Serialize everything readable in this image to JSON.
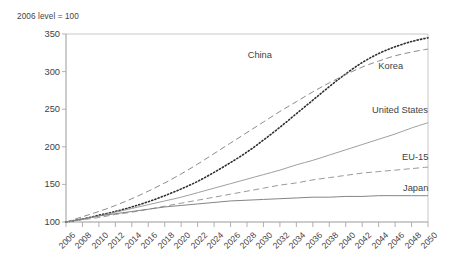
{
  "chart_data": {
    "type": "line",
    "title": "",
    "subtitle": "2006 level = 100",
    "xlabel": "",
    "ylabel": "",
    "xlim": [
      2006,
      2050
    ],
    "ylim": [
      100,
      350
    ],
    "yticks": [
      100,
      150,
      200,
      250,
      300,
      350
    ],
    "grid": false,
    "legend_position": "inline-right",
    "x": [
      2006,
      2008,
      2010,
      2012,
      2014,
      2016,
      2018,
      2020,
      2022,
      2024,
      2026,
      2028,
      2030,
      2032,
      2034,
      2036,
      2038,
      2040,
      2042,
      2044,
      2046,
      2048,
      2050
    ],
    "xticklabels": [
      "2006",
      "2008",
      "2010",
      "2012",
      "2014",
      "2016",
      "2018",
      "2020",
      "2022",
      "2024",
      "2026",
      "2028",
      "2030",
      "2032",
      "2034",
      "2036",
      "2038",
      "2040",
      "2042",
      "2044",
      "2046",
      "2048",
      "2050"
    ],
    "series": [
      {
        "name": "China",
        "style": "dotted",
        "color": "#2f2f2f",
        "label": "China",
        "label_x": 2034,
        "label_y": 318,
        "values": [
          100,
          104,
          109,
          114,
          120,
          127,
          135,
          144,
          154,
          166,
          179,
          193,
          209,
          226,
          244,
          262,
          280,
          297,
          312,
          324,
          333,
          340,
          345
        ]
      },
      {
        "name": "Korea",
        "style": "dashed",
        "color": "#8c8c8c",
        "label": "Korea",
        "label_x": 2042,
        "label_y": 303,
        "values": [
          100,
          107,
          114,
          122,
          131,
          141,
          152,
          164,
          177,
          191,
          205,
          219,
          233,
          247,
          260,
          273,
          285,
          296,
          306,
          314,
          321,
          326,
          330
        ]
      },
      {
        "name": "United States",
        "style": "solid-thin",
        "color": "#9a9a9a",
        "label": "United States",
        "label_x": 2040,
        "label_y": 247,
        "values": [
          100,
          104,
          108,
          113,
          118,
          123,
          128,
          133,
          139,
          145,
          151,
          157,
          163,
          169,
          176,
          182,
          189,
          196,
          203,
          210,
          217,
          225,
          232
        ]
      },
      {
        "name": "EU-15",
        "style": "dashed",
        "color": "#9a9a9a",
        "label": "EU-15",
        "label_x": 2041,
        "label_y": 185,
        "values": [
          100,
          103,
          106,
          110,
          113,
          117,
          121,
          125,
          129,
          133,
          137,
          141,
          145,
          149,
          152,
          156,
          159,
          162,
          165,
          167,
          169,
          171,
          173
        ]
      },
      {
        "name": "Japan",
        "style": "solid",
        "color": "#7d7d7d",
        "label": "Japan",
        "label_x": 2043,
        "label_y": 147,
        "values": [
          100,
          104,
          108,
          111,
          114,
          117,
          120,
          122,
          124,
          126,
          128,
          129,
          130,
          131,
          132,
          133,
          133,
          134,
          134,
          135,
          135,
          135,
          135
        ]
      }
    ]
  },
  "axes": {
    "top_rule_color": "#c8c8c8",
    "tick_color": "#a8a8a8",
    "axis_color": "#8e8e8e"
  }
}
